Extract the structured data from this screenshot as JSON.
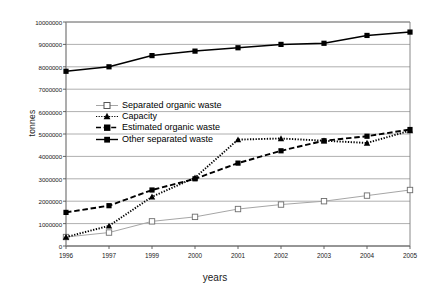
{
  "chart_data": {
    "type": "line",
    "title": "",
    "xlabel": "years",
    "ylabel": "tonnes",
    "categories": [
      "1996",
      "1997",
      "1999",
      "2000",
      "2001",
      "2002",
      "2003",
      "2004",
      "2005"
    ],
    "ylim": [
      0,
      10000000
    ],
    "yticks": [
      0,
      1000000,
      2000000,
      3000000,
      4000000,
      5000000,
      6000000,
      7000000,
      8000000,
      9000000,
      10000000
    ],
    "ytick_labels": [
      "0",
      "1000000",
      "2000000",
      "3000000",
      "4000000",
      "5000000",
      "6000000",
      "7000000",
      "8000000",
      "9000000",
      "10000000"
    ],
    "grid": true,
    "legend_position": "center-left",
    "series": [
      {
        "name": "Separated organic waste",
        "marker": "open-square",
        "line_style": "solid",
        "color": "#a6a6a6",
        "values": [
          400000,
          600000,
          1100000,
          1300000,
          1650000,
          1850000,
          2000000,
          2250000,
          2500000
        ]
      },
      {
        "name": "Capacity",
        "marker": "triangle",
        "line_style": "dotted",
        "color": "#000000",
        "values": [
          400000,
          900000,
          2200000,
          3050000,
          4750000,
          4800000,
          4700000,
          4600000,
          5150000
        ]
      },
      {
        "name": "Estimated organic waste",
        "marker": "filled-square",
        "line_style": "dashed",
        "color": "#000000",
        "values": [
          1500000,
          1800000,
          2500000,
          3000000,
          3700000,
          4250000,
          4700000,
          4900000,
          5200000
        ]
      },
      {
        "name": "Other separated waste",
        "marker": "filled-square",
        "line_style": "solid",
        "color": "#000000",
        "values": [
          7800000,
          8000000,
          8500000,
          8700000,
          8850000,
          9000000,
          9050000,
          9400000,
          9550000
        ]
      }
    ]
  },
  "axes": {
    "x_axis_label": "years",
    "y_axis_label": "tonnes"
  }
}
